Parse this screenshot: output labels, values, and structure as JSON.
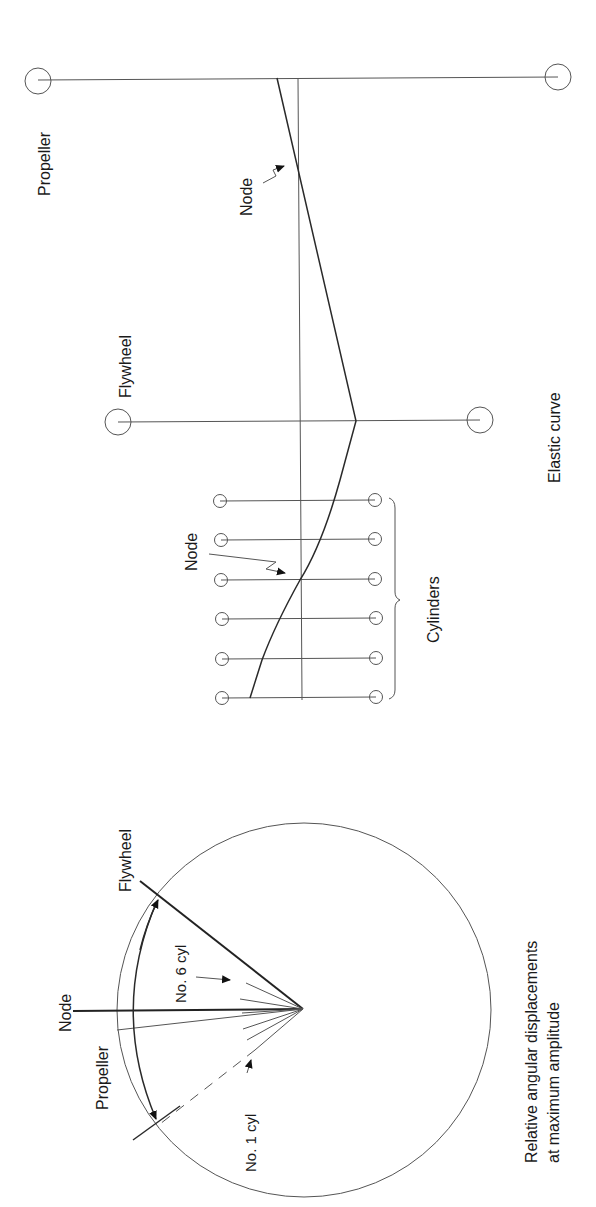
{
  "figure": {
    "orientation": "rotated-90-ccw",
    "upper_diagram": {
      "title": "Elastic curve",
      "labels": {
        "propeller": "Propeller",
        "flywheel": "Flywheel",
        "node_upper": "Node",
        "node_lower": "Node",
        "cylinders": "Cylinders",
        "elastic_curve": "Elastic curve"
      },
      "cylinder_count": 6
    },
    "lower_diagram": {
      "caption_line1": "Relative angular displacements",
      "caption_line2": "at maximum amplitude",
      "labels": {
        "node": "Node",
        "propeller": "Propeller",
        "flywheel": "Flywheel",
        "no6": "No. 6 cyl",
        "no1": "No. 1 cyl"
      }
    }
  }
}
